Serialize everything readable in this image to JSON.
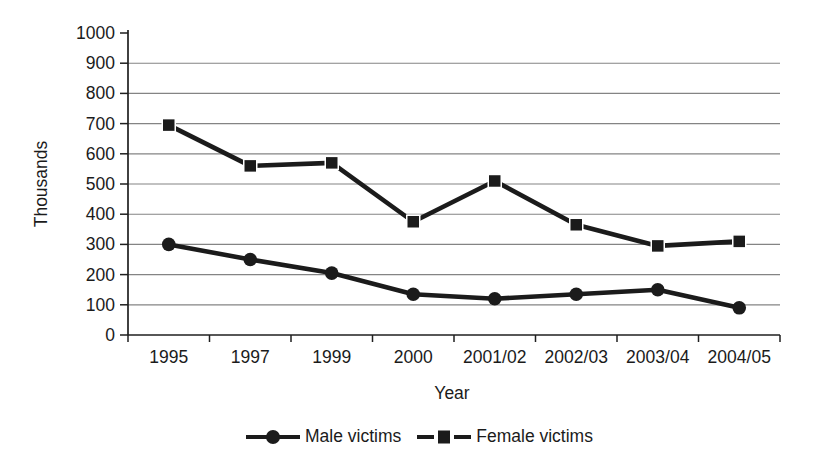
{
  "chart_data": {
    "type": "line",
    "title": "",
    "categories": [
      "1995",
      "1997",
      "1999",
      "2000",
      "2001/02",
      "2002/03",
      "2003/04",
      "2004/05"
    ],
    "series": [
      {
        "name": "Male victims",
        "marker": "circle",
        "values": [
          300,
          250,
          205,
          135,
          120,
          135,
          150,
          90
        ]
      },
      {
        "name": "Female victims",
        "marker": "square",
        "values": [
          695,
          560,
          570,
          375,
          510,
          365,
          295,
          310
        ]
      }
    ],
    "xlabel": "Year",
    "ylabel": "Thousands",
    "ylim": [
      0,
      1000
    ],
    "ytick_step": 100,
    "grid": "horizontal-gridlines-100-to-900",
    "legend_position": "bottom-center",
    "line_color": "#1b1b1b",
    "axis_color": "#1f1f1f",
    "grid_color": "#848484",
    "background_color": "#ffffff"
  },
  "legend": {
    "items": [
      {
        "label": "Male victims",
        "marker": "circle"
      },
      {
        "label": "Female victims",
        "marker": "square"
      }
    ]
  }
}
